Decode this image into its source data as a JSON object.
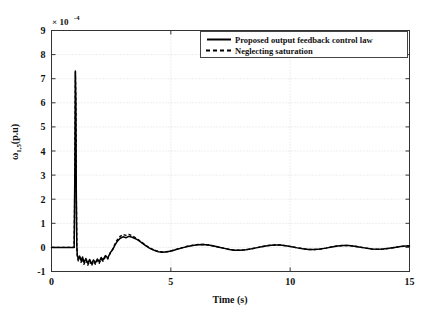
{
  "chart_data": {
    "type": "line",
    "title": "",
    "xlabel": "Time (s)",
    "ylabel": "ω 1,5 (p.u)",
    "ylabel_main": "ω",
    "ylabel_sub": "1,5",
    "ylabel_unit": "(p.u)",
    "y_exponent_prefix": "× 10",
    "y_exponent_power": "-4",
    "y_scale_factor": 0.0001,
    "xlim": [
      0,
      15
    ],
    "ylim": [
      -1,
      9
    ],
    "xticks": [
      0,
      5,
      10,
      15
    ],
    "xticklabels": [
      "0",
      "5",
      "10",
      "15"
    ],
    "yticks": [
      -1,
      0,
      1,
      2,
      3,
      4,
      5,
      6,
      7,
      8,
      9
    ],
    "yticklabels": [
      "-1",
      "0",
      "1",
      "2",
      "3",
      "4",
      "5",
      "6",
      "7",
      "8",
      "9"
    ],
    "grid": true,
    "grid_style": "dotted",
    "legend_position": "top-right",
    "legend": [
      {
        "name": "Proposed output feedback control law",
        "style": "solid"
      },
      {
        "name": "Neglecting saturation",
        "style": "dashed"
      }
    ],
    "series": [
      {
        "name": "Proposed output feedback control law",
        "style": "solid",
        "color": "#000000",
        "points": [
          [
            0.0,
            0.0
          ],
          [
            0.5,
            0.0
          ],
          [
            0.85,
            0.0
          ],
          [
            0.95,
            0.0
          ],
          [
            0.98,
            3.4
          ],
          [
            1.0,
            7.32
          ],
          [
            1.02,
            6.1
          ],
          [
            1.04,
            2.2
          ],
          [
            1.06,
            0.1
          ],
          [
            1.08,
            -0.3
          ],
          [
            1.12,
            -0.48
          ],
          [
            1.18,
            -0.36
          ],
          [
            1.24,
            -0.55
          ],
          [
            1.3,
            -0.4
          ],
          [
            1.36,
            -0.62
          ],
          [
            1.44,
            -0.46
          ],
          [
            1.52,
            -0.66
          ],
          [
            1.6,
            -0.5
          ],
          [
            1.68,
            -0.68
          ],
          [
            1.76,
            -0.52
          ],
          [
            1.84,
            -0.64
          ],
          [
            1.92,
            -0.48
          ],
          [
            2.0,
            -0.6
          ],
          [
            2.08,
            -0.42
          ],
          [
            2.16,
            -0.52
          ],
          [
            2.26,
            -0.34
          ],
          [
            2.36,
            -0.44
          ],
          [
            2.46,
            -0.22
          ],
          [
            2.56,
            -0.1
          ],
          [
            2.66,
            0.1
          ],
          [
            2.76,
            0.26
          ],
          [
            2.88,
            0.38
          ],
          [
            3.0,
            0.44
          ],
          [
            3.12,
            0.4
          ],
          [
            3.24,
            0.46
          ],
          [
            3.38,
            0.42
          ],
          [
            3.52,
            0.36
          ],
          [
            3.66,
            0.28
          ],
          [
            3.8,
            0.18
          ],
          [
            3.96,
            0.06
          ],
          [
            4.12,
            -0.04
          ],
          [
            4.3,
            -0.12
          ],
          [
            4.48,
            -0.18
          ],
          [
            4.66,
            -0.2
          ],
          [
            4.86,
            -0.18
          ],
          [
            5.06,
            -0.14
          ],
          [
            5.26,
            -0.08
          ],
          [
            5.48,
            -0.02
          ],
          [
            5.7,
            0.04
          ],
          [
            5.92,
            0.08
          ],
          [
            6.14,
            0.11
          ],
          [
            6.36,
            0.12
          ],
          [
            6.58,
            0.1
          ],
          [
            6.8,
            0.06
          ],
          [
            7.02,
            0.01
          ],
          [
            7.24,
            -0.04
          ],
          [
            7.46,
            -0.09
          ],
          [
            7.68,
            -0.12
          ],
          [
            7.9,
            -0.12
          ],
          [
            8.14,
            -0.1
          ],
          [
            8.38,
            -0.06
          ],
          [
            8.62,
            -0.01
          ],
          [
            8.86,
            0.04
          ],
          [
            9.1,
            0.08
          ],
          [
            9.34,
            0.1
          ],
          [
            9.58,
            0.1
          ],
          [
            9.82,
            0.07
          ],
          [
            10.06,
            0.03
          ],
          [
            10.3,
            -0.02
          ],
          [
            10.54,
            -0.06
          ],
          [
            10.78,
            -0.09
          ],
          [
            11.02,
            -0.09
          ],
          [
            11.26,
            -0.07
          ],
          [
            11.5,
            -0.03
          ],
          [
            11.74,
            0.02
          ],
          [
            11.98,
            0.06
          ],
          [
            12.22,
            0.08
          ],
          [
            12.46,
            0.08
          ],
          [
            12.7,
            0.05
          ],
          [
            12.94,
            0.01
          ],
          [
            13.18,
            -0.03
          ],
          [
            13.42,
            -0.07
          ],
          [
            13.66,
            -0.08
          ],
          [
            13.9,
            -0.07
          ],
          [
            14.14,
            -0.04
          ],
          [
            14.38,
            0.0
          ],
          [
            14.62,
            0.04
          ],
          [
            14.86,
            0.06
          ],
          [
            15.0,
            0.06
          ]
        ]
      },
      {
        "name": "Neglecting saturation",
        "style": "dashed",
        "color": "#000000",
        "points": [
          [
            0.0,
            0.0
          ],
          [
            0.5,
            0.0
          ],
          [
            0.85,
            0.0
          ],
          [
            0.95,
            0.0
          ],
          [
            0.98,
            3.2
          ],
          [
            1.0,
            7.28
          ],
          [
            1.02,
            6.0
          ],
          [
            1.04,
            2.1
          ],
          [
            1.06,
            0.05
          ],
          [
            1.08,
            -0.36
          ],
          [
            1.12,
            -0.56
          ],
          [
            1.18,
            -0.42
          ],
          [
            1.24,
            -0.62
          ],
          [
            1.3,
            -0.46
          ],
          [
            1.36,
            -0.7
          ],
          [
            1.44,
            -0.52
          ],
          [
            1.52,
            -0.74
          ],
          [
            1.6,
            -0.56
          ],
          [
            1.68,
            -0.76
          ],
          [
            1.76,
            -0.58
          ],
          [
            1.84,
            -0.7
          ],
          [
            1.92,
            -0.54
          ],
          [
            2.0,
            -0.66
          ],
          [
            2.08,
            -0.48
          ],
          [
            2.16,
            -0.58
          ],
          [
            2.26,
            -0.38
          ],
          [
            2.36,
            -0.48
          ],
          [
            2.46,
            -0.24
          ],
          [
            2.56,
            -0.08
          ],
          [
            2.66,
            0.14
          ],
          [
            2.76,
            0.32
          ],
          [
            2.88,
            0.46
          ],
          [
            3.0,
            0.54
          ],
          [
            3.12,
            0.5
          ],
          [
            3.24,
            0.54
          ],
          [
            3.38,
            0.48
          ],
          [
            3.52,
            0.4
          ],
          [
            3.66,
            0.3
          ],
          [
            3.8,
            0.2
          ],
          [
            3.96,
            0.08
          ],
          [
            4.12,
            -0.02
          ],
          [
            4.3,
            -0.11
          ],
          [
            4.48,
            -0.17
          ],
          [
            4.66,
            -0.19
          ],
          [
            4.86,
            -0.17
          ],
          [
            5.06,
            -0.13
          ],
          [
            5.26,
            -0.07
          ],
          [
            5.48,
            -0.01
          ],
          [
            5.7,
            0.05
          ],
          [
            5.92,
            0.09
          ],
          [
            6.14,
            0.12
          ],
          [
            6.36,
            0.12
          ],
          [
            6.58,
            0.1
          ],
          [
            6.8,
            0.06
          ],
          [
            7.02,
            0.01
          ],
          [
            7.24,
            -0.04
          ],
          [
            7.46,
            -0.09
          ],
          [
            7.68,
            -0.12
          ],
          [
            7.9,
            -0.12
          ],
          [
            8.14,
            -0.1
          ],
          [
            8.38,
            -0.06
          ],
          [
            8.62,
            -0.01
          ],
          [
            8.86,
            0.04
          ],
          [
            9.1,
            0.08
          ],
          [
            9.34,
            0.1
          ],
          [
            9.58,
            0.1
          ],
          [
            9.82,
            0.07
          ],
          [
            10.06,
            0.03
          ],
          [
            10.3,
            -0.02
          ],
          [
            10.54,
            -0.06
          ],
          [
            10.78,
            -0.09
          ],
          [
            11.02,
            -0.09
          ],
          [
            11.26,
            -0.07
          ],
          [
            11.5,
            -0.03
          ],
          [
            11.74,
            0.02
          ],
          [
            11.98,
            0.06
          ],
          [
            12.22,
            0.08
          ],
          [
            12.46,
            0.08
          ],
          [
            12.7,
            0.05
          ],
          [
            12.94,
            0.01
          ],
          [
            13.18,
            -0.03
          ],
          [
            13.42,
            -0.07
          ],
          [
            13.66,
            -0.08
          ],
          [
            13.9,
            -0.07
          ],
          [
            14.14,
            -0.04
          ],
          [
            14.38,
            0.0
          ],
          [
            14.62,
            0.04
          ],
          [
            14.86,
            0.06
          ],
          [
            15.0,
            0.06
          ]
        ]
      }
    ],
    "annotations": [
      {
        "text": "Spike peak at t ≈ 1 s reaching ≈ 7.3 × 10⁻⁴ p.u"
      }
    ]
  }
}
